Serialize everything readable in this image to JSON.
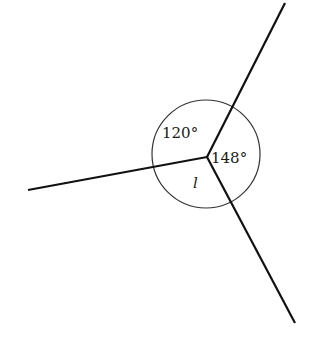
{
  "diagram": {
    "type": "angles-around-a-point",
    "center": {
      "x": 207,
      "y": 157
    },
    "circle_radius": 54,
    "rays": [
      {
        "name": "ray-upper-right",
        "end": {
          "x": 285,
          "y": 3
        }
      },
      {
        "name": "ray-left",
        "end": {
          "x": 28,
          "y": 190
        }
      },
      {
        "name": "ray-lower-right",
        "end": {
          "x": 295,
          "y": 323
        }
      }
    ],
    "angles": [
      {
        "label": "120°",
        "between": "ray-left and ray-upper-right",
        "x": 162,
        "y": 138
      },
      {
        "label": "148°",
        "between": "ray-upper-right and ray-lower-right",
        "x": 211,
        "y": 163
      },
      {
        "label": "l",
        "between": "ray-lower-right and ray-left",
        "x": 193,
        "y": 186,
        "italic": true
      }
    ],
    "stroke_color": "#111111",
    "background": "#ffffff"
  }
}
